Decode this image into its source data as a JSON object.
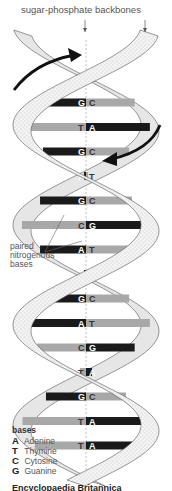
{
  "labels": {
    "backbones": "sugar-phosphate backbones",
    "paired_bases": "paired nitrogenous bases"
  },
  "colors": {
    "purine_bar": "#1a1a1a",
    "pyrimidine_bar": "#a8a8a8",
    "backbone_fill": "#ececec",
    "backbone_stroke": "#555555",
    "arrow": "#111111"
  },
  "base_pairs": [
    {
      "left": "G",
      "right": "C"
    },
    {
      "left": "G",
      "right": "C"
    },
    {
      "left": "T",
      "right": "A"
    },
    {
      "left": "G",
      "right": "C"
    },
    {
      "left": "A",
      "right": "T"
    },
    {
      "left": "G",
      "right": "C"
    },
    {
      "left": "C",
      "right": "G"
    },
    {
      "left": "A",
      "right": "T"
    },
    {
      "left": "A",
      "right": "T"
    },
    {
      "left": "G",
      "right": "C"
    },
    {
      "left": "A",
      "right": "T"
    },
    {
      "left": "C",
      "right": "G"
    },
    {
      "left": "T",
      "right": "A"
    },
    {
      "left": "G",
      "right": "C"
    },
    {
      "left": "T",
      "right": "A"
    },
    {
      "left": "T",
      "right": "A"
    }
  ],
  "legend": {
    "title": "bases",
    "items": [
      {
        "letter": "A",
        "name": "Adenine"
      },
      {
        "letter": "T",
        "name": "Thymine"
      },
      {
        "letter": "C",
        "name": "Cytosine"
      },
      {
        "letter": "G",
        "name": "Guanine"
      }
    ]
  },
  "caption": "Encyclopaedia Britannica"
}
